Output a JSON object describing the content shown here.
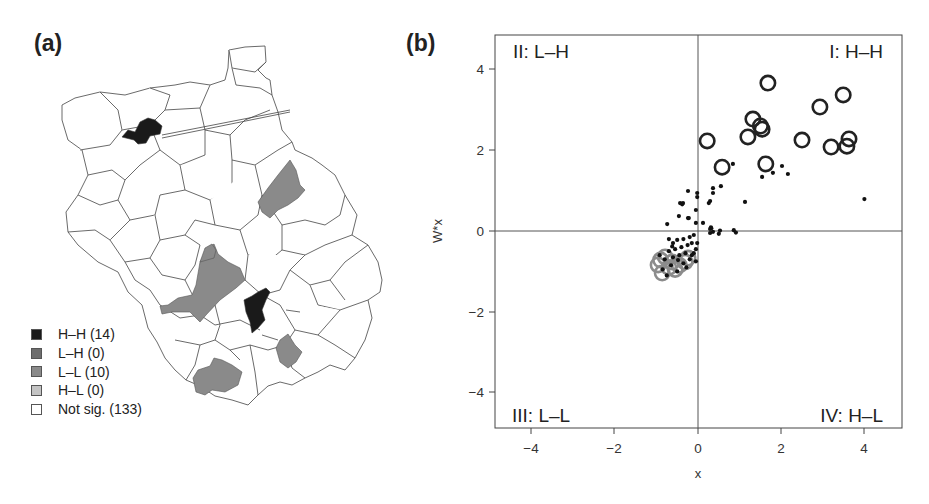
{
  "panels": {
    "a": {
      "label": "(a)"
    },
    "b": {
      "label": "(b)"
    }
  },
  "colors": {
    "hh": "#1a1a1a",
    "lh": "#6e6e6e",
    "ll": "#8a8a8a",
    "hl": "#c4c4c4",
    "not_sig": "#ffffff",
    "outline": "#444444",
    "ll_circle": "#8c8c8c",
    "hh_circle": "#222222",
    "point": "#111111"
  },
  "map_legend": {
    "items": [
      {
        "key": "hh",
        "label": "H–H (14)"
      },
      {
        "key": "lh",
        "label": "L–H (0)"
      },
      {
        "key": "ll",
        "label": "L–L (10)"
      },
      {
        "key": "hl",
        "label": "H–L (0)"
      },
      {
        "key": "not_sig",
        "label": "Not sig. (133)"
      }
    ]
  },
  "chart_data": [
    {
      "type": "map",
      "title": "(a)",
      "legend": [
        {
          "category": "H–H",
          "count": 14
        },
        {
          "category": "L–H",
          "count": 0
        },
        {
          "category": "L–L",
          "count": 10
        },
        {
          "category": "H–L",
          "count": 0
        },
        {
          "category": "Not sig.",
          "count": 133
        }
      ],
      "legend_position": "bottom-left"
    },
    {
      "type": "scatter",
      "title": "(b)",
      "xlabel": "x",
      "ylabel": "W*x",
      "xlim": [
        -4.9,
        4.9
      ],
      "ylim": [
        -4.9,
        4.85
      ],
      "xticks": [
        -4,
        -2,
        0,
        2,
        4
      ],
      "yticks": [
        -4,
        -2,
        0,
        2,
        4
      ],
      "grid": false,
      "reference_lines": {
        "x": 0,
        "y": 0
      },
      "quadrant_labels": {
        "top_left": "II: L–H",
        "top_right": "I: H–H",
        "bottom_left": "III: L–L",
        "bottom_right": "IV: H–L"
      },
      "series": [
        {
          "name": "H–H (significant)",
          "marker": "open-circle-black",
          "points": [
            [
              1.68,
              3.66
            ],
            [
              1.32,
              2.77
            ],
            [
              1.54,
              2.52
            ],
            [
              1.2,
              2.33
            ],
            [
              0.22,
              2.23
            ],
            [
              0.58,
              1.58
            ],
            [
              1.63,
              1.66
            ],
            [
              3.49,
              3.37
            ],
            [
              2.93,
              3.07
            ],
            [
              2.5,
              2.25
            ],
            [
              3.2,
              2.08
            ],
            [
              3.63,
              2.28
            ],
            [
              3.58,
              2.1
            ],
            [
              1.5,
              2.6
            ]
          ]
        },
        {
          "name": "L–L (significant)",
          "marker": "open-circle-gray",
          "points": [
            [
              -0.96,
              -0.84
            ],
            [
              -0.86,
              -1.04
            ],
            [
              -0.62,
              -0.77
            ],
            [
              -0.31,
              -0.77
            ],
            [
              -0.24,
              -0.67
            ],
            [
              -0.79,
              -0.64
            ],
            [
              -0.55,
              -0.95
            ],
            [
              -0.45,
              -0.85
            ],
            [
              -0.7,
              -0.9
            ],
            [
              -0.9,
              -0.72
            ]
          ]
        },
        {
          "name": "Not significant",
          "marker": "dot",
          "points": [
            [
              0.84,
              1.66
            ],
            [
              1.54,
              1.34
            ],
            [
              1.8,
              1.44
            ],
            [
              2.02,
              1.61
            ],
            [
              2.16,
              1.41
            ],
            [
              4.0,
              0.79
            ],
            [
              1.13,
              0.72
            ],
            [
              0.55,
              1.11
            ],
            [
              0.36,
              1.06
            ],
            [
              0.36,
              0.94
            ],
            [
              0.29,
              0.74
            ],
            [
              0.26,
              0.69
            ],
            [
              -0.24,
              0.99
            ],
            [
              -0.02,
              0.94
            ],
            [
              -0.02,
              0.84
            ],
            [
              -0.43,
              0.69
            ],
            [
              -0.36,
              0.69
            ],
            [
              -0.38,
              0.66
            ],
            [
              -0.05,
              0.52
            ],
            [
              -0.46,
              0.37
            ],
            [
              -0.24,
              0.32
            ],
            [
              -0.22,
              0.32
            ],
            [
              -0.05,
              0.2
            ],
            [
              0.12,
              0.2
            ],
            [
              -0.74,
              0.17
            ],
            [
              0.31,
              0.09
            ],
            [
              0.32,
              0.07
            ],
            [
              0.36,
              -0.02
            ],
            [
              0.5,
              -0.07
            ],
            [
              0.53,
              0.01
            ],
            [
              0.86,
              0.02
            ],
            [
              0.91,
              -0.04
            ],
            [
              0.29,
              -0.05
            ],
            [
              0.29,
              0.05
            ],
            [
              -0.1,
              -0.1
            ],
            [
              -0.2,
              -0.15
            ],
            [
              -0.35,
              -0.2
            ],
            [
              -0.5,
              -0.22
            ],
            [
              -0.6,
              -0.3
            ],
            [
              -0.15,
              -0.3
            ],
            [
              -0.25,
              -0.35
            ],
            [
              -0.4,
              -0.4
            ],
            [
              -0.55,
              -0.45
            ],
            [
              -0.7,
              -0.5
            ],
            [
              -0.05,
              -0.45
            ],
            [
              -0.1,
              -0.55
            ],
            [
              -0.3,
              -0.55
            ],
            [
              -0.45,
              -0.6
            ],
            [
              -0.6,
              -0.65
            ],
            [
              -0.8,
              -0.7
            ],
            [
              -0.2,
              -0.7
            ],
            [
              -0.05,
              -0.75
            ],
            [
              -0.35,
              -0.8
            ],
            [
              -0.65,
              -0.85
            ],
            [
              -0.5,
              -1.0
            ],
            [
              -0.75,
              -1.1
            ],
            [
              -0.85,
              -0.95
            ],
            [
              -0.15,
              -0.6
            ],
            [
              -0.02,
              -0.3
            ],
            [
              -0.62,
              -0.38
            ],
            [
              -0.48,
              -0.72
            ],
            [
              -0.28,
              -0.9
            ],
            [
              -0.92,
              -0.6
            ],
            [
              -0.7,
              -0.2
            ]
          ]
        }
      ]
    }
  ],
  "scatter": {
    "xticks": [
      "−4",
      "−2",
      "0",
      "2",
      "4"
    ],
    "yticks": [
      "4",
      "2",
      "0",
      "−2",
      "−4"
    ],
    "xlabel": "x",
    "ylabel": "W*x",
    "quad_tl": "II: L–H",
    "quad_tr": "I: H–H",
    "quad_bl": "III: L–L",
    "quad_br": "IV: H–L"
  }
}
